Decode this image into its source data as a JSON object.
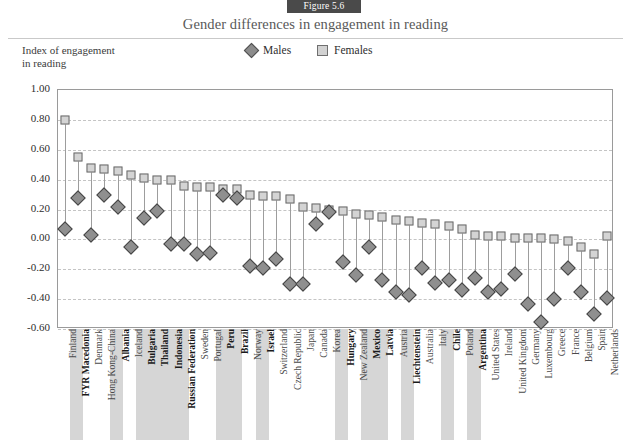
{
  "figure": {
    "badge": "Figure 5.6",
    "title": "Gender differences in engagement in reading"
  },
  "axis_caption": {
    "line1": "Index of engagement",
    "line2": "in reading"
  },
  "legend": [
    {
      "label": "Males",
      "marker": "diamond-icon",
      "color": "#8c8c8c"
    },
    {
      "label": "Females",
      "marker": "square-icon",
      "color": "#d2d2d2"
    }
  ],
  "chart_data": {
    "type": "scatter",
    "title": "Gender differences in engagement in reading",
    "xlabel": "",
    "ylabel": "Index of engagement in reading",
    "ylim": [
      -0.6,
      1.0
    ],
    "ytick_labels": [
      "1.00",
      "0.80",
      "0.60",
      "0.40",
      "0.20",
      "0.00",
      "-0.20",
      "-0.40",
      "-0.60"
    ],
    "ytick_values": [
      1.0,
      0.8,
      0.6,
      0.4,
      0.2,
      0.0,
      -0.2,
      -0.4,
      -0.6
    ],
    "grid": true,
    "legend_position": "top-center",
    "categories": [
      "Finland",
      "FYR Macedonia",
      "Denmark",
      "Hong Kong-China",
      "Albania",
      "Iceland",
      "Bulgaria",
      "Thailand",
      "Indonesia",
      "Russian Federation",
      "Sweden",
      "Portugal",
      "Peru",
      "Brazil",
      "Norway",
      "Israel",
      "Switzerland",
      "Czech Republic",
      "Japan",
      "Canada",
      "Korea",
      "Hungary",
      "New Zealand",
      "Mexico",
      "Latvia",
      "Austria",
      "Liechtenstein",
      "Australia",
      "Italy",
      "Chile",
      "Poland",
      "Argentina",
      "United States",
      "Ireland",
      "United Kingdom",
      "Germany",
      "Luxembourg",
      "Greece",
      "France",
      "Belgium",
      "Spain",
      "Netherlands"
    ],
    "highlighted_categories": [
      "FYR Macedonia",
      "Albania",
      "Bulgaria",
      "Thailand",
      "Indonesia",
      "Russian Federation",
      "Peru",
      "Brazil",
      "Israel",
      "Hungary",
      "Mexico",
      "Latvia",
      "Liechtenstein",
      "Chile",
      "Argentina"
    ],
    "series": [
      {
        "name": "Females",
        "values": [
          0.8,
          0.55,
          0.48,
          0.47,
          0.46,
          0.43,
          0.41,
          0.4,
          0.4,
          0.36,
          0.35,
          0.35,
          0.34,
          0.34,
          0.3,
          0.29,
          0.29,
          0.27,
          0.22,
          0.21,
          0.2,
          0.19,
          0.17,
          0.16,
          0.15,
          0.13,
          0.12,
          0.11,
          0.1,
          0.09,
          0.07,
          0.03,
          0.02,
          0.02,
          0.01,
          0.01,
          0.01,
          0.0,
          -0.01,
          -0.05,
          -0.1,
          0.02
        ]
      },
      {
        "name": "Males",
        "values": [
          0.07,
          0.28,
          0.03,
          0.3,
          0.22,
          -0.05,
          0.14,
          0.19,
          -0.03,
          -0.03,
          -0.1,
          -0.09,
          0.3,
          0.28,
          -0.18,
          -0.19,
          -0.13,
          -0.3,
          -0.3,
          0.1,
          0.18,
          -0.15,
          -0.24,
          -0.05,
          -0.27,
          -0.35,
          -0.37,
          -0.19,
          -0.29,
          -0.27,
          -0.34,
          -0.26,
          -0.35,
          -0.33,
          -0.23,
          -0.43,
          -0.55,
          -0.4,
          -0.19,
          -0.35,
          -0.5,
          -0.39
        ]
      }
    ]
  }
}
